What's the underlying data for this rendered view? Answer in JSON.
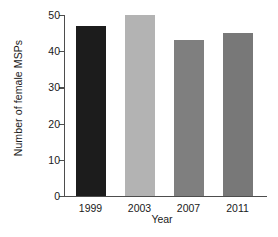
{
  "chart_data": {
    "type": "bar",
    "title": "",
    "xlabel": "Year",
    "ylabel": "Number of female MSPs",
    "categories": [
      "1999",
      "2003",
      "2007",
      "2011"
    ],
    "values": [
      47,
      50,
      43,
      45
    ],
    "bar_colors": [
      "#1c1c1c",
      "#b3b3b3",
      "#7f7f7f",
      "#787878"
    ],
    "ylim": [
      0,
      50
    ],
    "yticks": [
      0,
      10,
      20,
      30,
      40,
      50
    ],
    "ytick_labels": [
      "0",
      "10",
      "20",
      "30",
      "40",
      "50"
    ],
    "grid": false,
    "legend": false,
    "axis_color": "#4d4d4d",
    "text_color": "#1a1a1a",
    "background": "#ffffff"
  }
}
